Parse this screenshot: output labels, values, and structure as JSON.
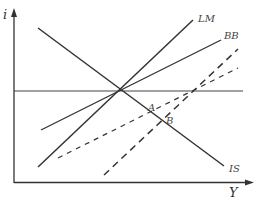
{
  "diagram": {
    "type": "IS-LM-BB macroeconomic diagram",
    "axes": {
      "y_label": "i",
      "x_label": "Y"
    },
    "curves": [
      {
        "id": "IS",
        "label": "IS",
        "style": "solid"
      },
      {
        "id": "LM",
        "label": "LM",
        "style": "solid"
      },
      {
        "id": "BB",
        "label": "BB",
        "style": "solid"
      },
      {
        "id": "horizontal",
        "label": "",
        "style": "solid"
      },
      {
        "id": "LM_shifted",
        "label": "",
        "style": "dashed"
      },
      {
        "id": "BB_shifted",
        "label": "",
        "style": "dashed"
      }
    ],
    "points": [
      {
        "id": "A",
        "label": "A"
      },
      {
        "id": "B",
        "label": "B"
      }
    ],
    "colors": {
      "axis": "#333333",
      "line": "#333333",
      "label": "#444444"
    }
  }
}
